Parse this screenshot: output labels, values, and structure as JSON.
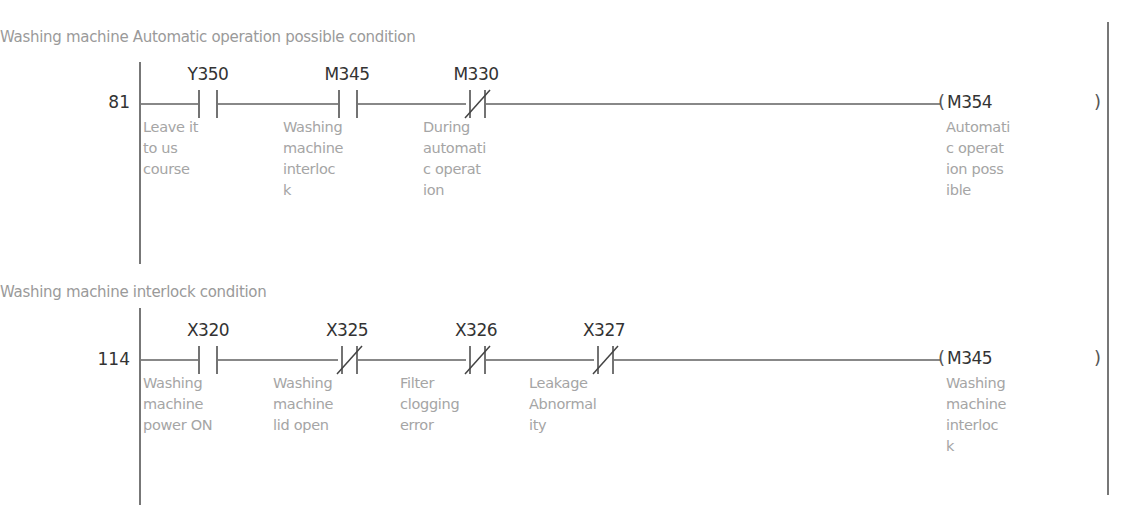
{
  "rungs": [
    {
      "comment": "Washing machine Automatic operation possible condition",
      "step": "81",
      "contacts": [
        {
          "device": "Y350",
          "type": "NO",
          "desc": "Leave it\nto us\ncourse"
        },
        {
          "device": "M345",
          "type": "NO",
          "desc": "Washing\nmachine\ninterloc\nk"
        },
        {
          "device": "M330",
          "type": "NC",
          "desc": "During\nautomati\nc operat\nion"
        }
      ],
      "coil": {
        "device": "M354",
        "open": "(",
        "close": ")",
        "desc": "Automati\nc operat\nion poss\nible"
      }
    },
    {
      "comment": "Washing machine interlock condition",
      "step": "114",
      "contacts": [
        {
          "device": "X320",
          "type": "NO",
          "desc": "Washing\nmachine\npower ON"
        },
        {
          "device": "X325",
          "type": "NC",
          "desc": "Washing\nmachine\nlid open"
        },
        {
          "device": "X326",
          "type": "NC",
          "desc": "Filter\nclogging\nerror"
        },
        {
          "device": "X327",
          "type": "NC",
          "desc": "Leakage\nAbnormal\nity"
        }
      ],
      "coil": {
        "device": "M345",
        "open": "(",
        "close": ")",
        "desc": "Washing\nmachine\ninterloc\nk"
      }
    }
  ],
  "colors": {
    "wire": "#888888",
    "text": "#333333",
    "comment": "#9a9a9a"
  }
}
